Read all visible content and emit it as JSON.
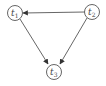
{
  "diagram": {
    "type": "directed-graph",
    "nodes": [
      {
        "id": "t1",
        "label": "t",
        "sub": "1",
        "x": 15,
        "y": 13
      },
      {
        "id": "t2",
        "label": "t",
        "sub": "2",
        "x": 92,
        "y": 12
      },
      {
        "id": "t3",
        "label": "t",
        "sub": "3",
        "x": 54,
        "y": 72
      }
    ],
    "edges": [
      {
        "from": "t2",
        "to": "t1"
      },
      {
        "from": "t1",
        "to": "t3"
      },
      {
        "from": "t2",
        "to": "t3"
      }
    ],
    "colors": {
      "stroke": "#555555",
      "background": "#ffffff"
    }
  }
}
